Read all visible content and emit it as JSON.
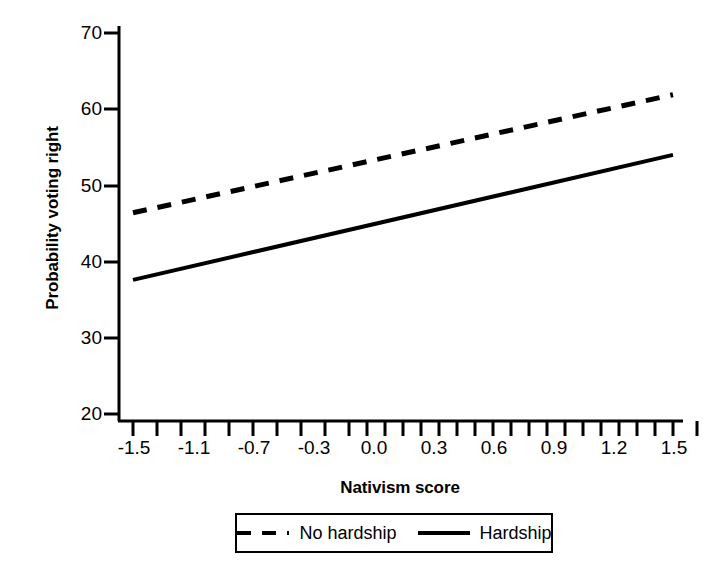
{
  "chart_data": {
    "type": "line",
    "title": "",
    "subtitle": "",
    "xlabel": "Nativism score",
    "ylabel": "Probability voting right",
    "xlim": [
      -1.5,
      1.5
    ],
    "ylim": [
      20,
      70
    ],
    "grid": false,
    "legend_position": "bottom",
    "x_ticks": [
      "-1.5",
      "-1.1",
      "-0.7",
      "-0.3",
      "0.0",
      "0.3",
      "0.6",
      "0.9",
      "1.2",
      "1.5"
    ],
    "x_tick_values": [
      -1.5,
      -1.1,
      -0.7,
      -0.3,
      0.0,
      0.3,
      0.6,
      0.9,
      1.2,
      1.5
    ],
    "y_ticks": [
      "20",
      "30",
      "40",
      "50",
      "60",
      "70"
    ],
    "y_tick_values": [
      20,
      30,
      40,
      50,
      60,
      70
    ],
    "x": [
      -1.5,
      1.5
    ],
    "series": [
      {
        "name": "No hardship",
        "style": "dashed",
        "color": "#000000",
        "values": [
          46.4,
          61.9
        ]
      },
      {
        "name": "Hardship",
        "style": "solid",
        "color": "#000000",
        "values": [
          37.6,
          54.0
        ]
      }
    ]
  },
  "axes": {
    "y_title": "Probability voting right",
    "x_title": "Nativism score",
    "y_tick_labels": [
      "70",
      "60",
      "50",
      "40",
      "30",
      "20"
    ],
    "x_tick_labels": [
      "-1.5",
      "-1.1",
      "-0.7",
      "-0.3",
      "0.0",
      "0.3",
      "0.6",
      "0.9",
      "1.2",
      "1.5"
    ]
  },
  "legend": {
    "entries": [
      {
        "label": "No hardship",
        "style": "dashed"
      },
      {
        "label": "Hardship",
        "style": "solid"
      }
    ]
  },
  "colors": {
    "line": "#000000",
    "axis": "#000000",
    "background": "#ffffff"
  }
}
